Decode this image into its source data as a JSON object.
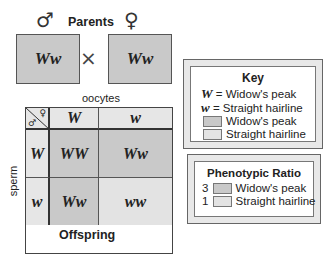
{
  "parents": {
    "title": "Parents",
    "male_symbol": "♂",
    "female_symbol": "♀",
    "male_genotype": "Ww",
    "female_genotype": "Ww",
    "cross_symbol": "×"
  },
  "punnett": {
    "top_label": "oocytes",
    "side_label": "sperm",
    "bottom_label": "Offspring",
    "corner_symbols": {
      "female": "♀",
      "male": "♂"
    },
    "column_headers": [
      "W",
      "w"
    ],
    "row_headers": [
      "W",
      "w"
    ],
    "cells": [
      [
        {
          "genotype": "WW",
          "phenotype": "widows_peak"
        },
        {
          "genotype": "Ww",
          "phenotype": "widows_peak"
        }
      ],
      [
        {
          "genotype": "Ww",
          "phenotype": "widows_peak"
        },
        {
          "genotype": "ww",
          "phenotype": "straight_hairline"
        }
      ]
    ]
  },
  "key": {
    "title": "Key",
    "alleles": [
      {
        "symbol": "W",
        "eq": "=",
        "label": "Widow's peak"
      },
      {
        "symbol": "w",
        "eq": "=",
        "label": "Straight hairline"
      }
    ],
    "swatches": [
      {
        "label": "Widow's peak",
        "color": "#c9c9c9"
      },
      {
        "label": "Straight hairline",
        "color": "#e3e3e3"
      }
    ]
  },
  "ratio": {
    "title": "Phenotypic Ratio",
    "items": [
      {
        "count": "3",
        "label": "Widow's peak",
        "color": "#c9c9c9"
      },
      {
        "count": "1",
        "label": "Straight hairline",
        "color": "#e3e3e3"
      }
    ]
  },
  "colors": {
    "dominant_fill": "#c9c9c9",
    "recessive_fill": "#e3e3e3",
    "border": "#444444"
  }
}
